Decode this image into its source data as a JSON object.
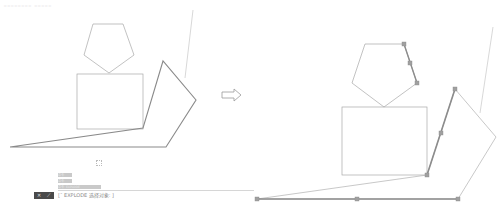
{
  "header": {
    "caption": "________ _____"
  },
  "left_panel": {
    "label": "before",
    "pentagon": [
      [
        93,
        24
      ],
      [
        123,
        24
      ],
      [
        134,
        55
      ],
      [
        109,
        73
      ],
      [
        84,
        55
      ]
    ],
    "rectangle": {
      "x": 77,
      "y": 74,
      "w": 66,
      "h": 55
    },
    "polyline": [
      [
        10,
        147
      ],
      [
        143,
        128
      ],
      [
        163,
        61
      ],
      [
        196,
        100
      ],
      [
        166,
        147
      ],
      [
        10,
        147
      ]
    ],
    "construction_line": [
      [
        193,
        10
      ],
      [
        185,
        78
      ]
    ],
    "stroke_color": "#9a9a9a",
    "polyline_color": "#888888"
  },
  "arrow": {
    "icon": "right-arrow-icon",
    "x": 222,
    "y": 95,
    "color": "#9a9a9a"
  },
  "right_panel": {
    "label": "after",
    "pentagon": [
      [
        365,
        44
      ],
      [
        404,
        44
      ],
      [
        417,
        83
      ],
      [
        384,
        107
      ],
      [
        352,
        83
      ]
    ],
    "pentagon_selected_edge": [
      [
        404,
        44
      ],
      [
        417,
        83
      ]
    ],
    "pentagon_grips": [
      [
        404,
        44
      ],
      [
        410,
        63
      ],
      [
        417,
        83
      ]
    ],
    "rectangle": {
      "x": 342,
      "y": 107,
      "w": 85,
      "h": 68
    },
    "polyline": [
      [
        257,
        199
      ],
      [
        427,
        175
      ],
      [
        455,
        89
      ],
      [
        496,
        137
      ],
      [
        458,
        199
      ],
      [
        257,
        199
      ]
    ],
    "selected_segments": [
      [
        [
          427,
          175
        ],
        [
          455,
          89
        ]
      ],
      [
        [
          257,
          199
        ],
        [
          458,
          199
        ]
      ]
    ],
    "grips": [
      [
        257,
        199
      ],
      [
        357,
        199
      ],
      [
        458,
        199
      ],
      [
        427,
        175
      ],
      [
        441,
        133
      ],
      [
        455,
        89
      ]
    ],
    "construction_line": [
      [
        493,
        27
      ],
      [
        480,
        113
      ]
    ],
    "grip_color": "#a0a0a0",
    "selected_color": "#8c8c8c"
  },
  "command_line": {
    "history": [
      "命令:",
      "命令:",
      "命令: EXPLODE"
    ],
    "buttons": [
      "✕",
      "⟋"
    ],
    "prompt": "[¯ EXPLODE 选择对象: ]"
  }
}
